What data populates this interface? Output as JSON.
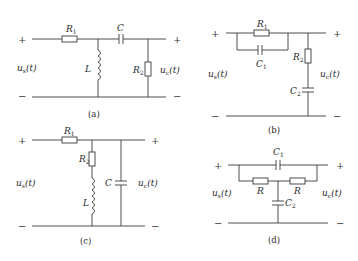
{
  "figures": [
    {
      "id": "a",
      "caption": "(a)",
      "input_label": "u",
      "input_sub": "s",
      "output_label": "u",
      "output_sub": "c",
      "time_arg": "(t)",
      "plus": "+",
      "minus": "−",
      "components": [
        {
          "name": "R",
          "sub": "1"
        },
        {
          "name": "C",
          "sub": ""
        },
        {
          "name": "L",
          "sub": ""
        },
        {
          "name": "R",
          "sub": "2"
        }
      ]
    },
    {
      "id": "b",
      "caption": "(b)",
      "input_label": "u",
      "input_sub": "s",
      "output_label": "u",
      "output_sub": "c",
      "time_arg": "(t)",
      "plus": "+",
      "minus": "−",
      "components": [
        {
          "name": "R",
          "sub": "1"
        },
        {
          "name": "C",
          "sub": "1"
        },
        {
          "name": "R",
          "sub": "2"
        },
        {
          "name": "C",
          "sub": "2"
        }
      ]
    },
    {
      "id": "c",
      "caption": "(c)",
      "input_label": "u",
      "input_sub": "s",
      "output_label": "u",
      "output_sub": "c",
      "time_arg": "(t)",
      "plus": "+",
      "minus": "−",
      "components": [
        {
          "name": "R",
          "sub": "1"
        },
        {
          "name": "R",
          "sub": "2"
        },
        {
          "name": "L",
          "sub": ""
        },
        {
          "name": "C",
          "sub": ""
        }
      ]
    },
    {
      "id": "d",
      "caption": "(d)",
      "input_label": "u",
      "input_sub": "s",
      "output_label": "u",
      "output_sub": "c",
      "time_arg": "(t)",
      "plus": "+",
      "minus": "−",
      "components": [
        {
          "name": "C",
          "sub": "1"
        },
        {
          "name": "R",
          "sub": ""
        },
        {
          "name": "R",
          "sub": ""
        },
        {
          "name": "C",
          "sub": "2"
        }
      ]
    }
  ]
}
